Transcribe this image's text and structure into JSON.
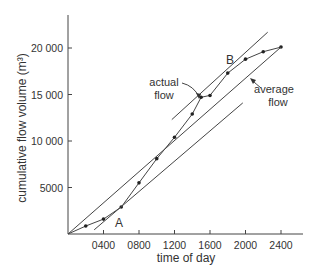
{
  "chart_data": {
    "type": "line",
    "title": "",
    "xlabel": "time of day",
    "ylabel": "cumulative flow volume (m³)",
    "xlim": [
      0,
      2700
    ],
    "ylim": [
      0,
      23000
    ],
    "grid": false,
    "legend": null,
    "x_ticks": [
      400,
      800,
      1200,
      1600,
      2000,
      2400
    ],
    "x_tick_labels": [
      "0400",
      "0800",
      "1200",
      "1600",
      "2000",
      "2400"
    ],
    "y_ticks": [
      5000,
      10000,
      15000,
      20000
    ],
    "y_tick_labels": [
      "5000",
      "10 000",
      "15 000",
      "20 000"
    ],
    "series": [
      {
        "name": "actual flow",
        "style": "line-with-markers",
        "x": [
          0,
          200,
          400,
          600,
          800,
          1000,
          1200,
          1400,
          1500,
          1600,
          1800,
          2000,
          2200,
          2400
        ],
        "y": [
          0,
          860,
          1600,
          2900,
          5500,
          8100,
          10400,
          12900,
          14700,
          14900,
          17300,
          18800,
          19600,
          20100
        ]
      },
      {
        "name": "average flow",
        "style": "line",
        "x": [
          0,
          2400
        ],
        "y": [
          0,
          20100
        ]
      },
      {
        "name": "tangent at B",
        "style": "line",
        "x": [
          1170,
          2250
        ],
        "y": [
          12300,
          21700
        ]
      },
      {
        "name": "tangent at A",
        "style": "line",
        "x": [
          295,
          1970
        ],
        "y": [
          450,
          14100
        ]
      }
    ],
    "annotations": [
      {
        "text": "A",
        "x": 580,
        "y": 1300
      },
      {
        "text": "B",
        "x": 1730,
        "y": 18800
      },
      {
        "text": "actual flow",
        "arrow_to": [
          1480,
          14700
        ]
      },
      {
        "text": "average flow",
        "arrow_to": [
          2060,
          16600
        ]
      }
    ]
  },
  "labels": {
    "x_axis_title": "time of day",
    "y_axis_title": "cumulative flow volume (m³)",
    "actual_flow_line1": "actual",
    "actual_flow_line2": "flow",
    "average_flow_line1": "average",
    "average_flow_line2": "flow",
    "point_a": "A",
    "point_b": "B"
  },
  "colors": {
    "line": "#444444",
    "text": "#333333",
    "background": "#ffffff"
  }
}
